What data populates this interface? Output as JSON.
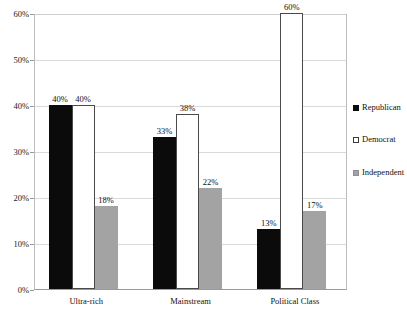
{
  "chart_data": {
    "type": "bar",
    "title": "",
    "subtitle": "",
    "xlabel": "",
    "ylabel": "",
    "ylim": [
      0,
      60
    ],
    "ytick_labels": [
      "0%",
      "10%",
      "20%",
      "30%",
      "40%",
      "50%",
      "60%"
    ],
    "ytick_values": [
      0,
      10,
      20,
      30,
      40,
      50,
      60
    ],
    "grid": true,
    "grid_axis": "y",
    "legend_position": "right",
    "categories": [
      "Ultra-rich",
      "Mainstream",
      "Political Class"
    ],
    "series": [
      {
        "name": "Republican",
        "color": "#0b0b0b",
        "values": [
          40,
          33,
          13
        ],
        "labels": [
          "40%",
          "33%",
          "13%"
        ]
      },
      {
        "name": "Democrat",
        "color": "#ffffff",
        "values": [
          40,
          38,
          60
        ],
        "labels": [
          "40%",
          "38%",
          "60%"
        ]
      },
      {
        "name": "Independent",
        "color": "#a3a3a3",
        "values": [
          18,
          22,
          17
        ],
        "labels": [
          "18%",
          "22%",
          "17%"
        ]
      }
    ]
  },
  "legend": {
    "items": [
      {
        "label": "Republican",
        "swatch": "filled-black-square-icon"
      },
      {
        "label": "Democrat",
        "swatch": "hollow-square-icon"
      },
      {
        "label": "Independent",
        "swatch": "filled-gray-square-icon"
      }
    ]
  },
  "colors": {
    "republican": "#0b0b0b",
    "democrat": "#ffffff",
    "independent": "#a3a3a3",
    "gridline": "#d9d9d9",
    "axis": "#9a9a9a",
    "background": "#ffffff",
    "text": "#111111"
  }
}
